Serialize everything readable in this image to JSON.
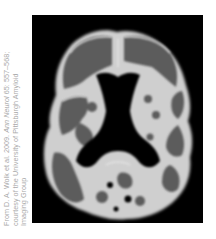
{
  "figure": {
    "image_description": "Axial PET amyloid brain scan (grayscale)",
    "colors": {
      "background": "#000000",
      "tissue_dark": "#5a5a5a",
      "tissue_bright": "#d8d8d8",
      "caption_text": "#a9a9a9"
    },
    "caption": {
      "line1_prefix": "From D. A. Wolk et al. 2009. ",
      "line1_journal": "Ann Neurol",
      "line1_suffix": " 65: 557–568;",
      "line2": "courtesy of the University of Pittsburgh Amyloid",
      "line3": "Imaging Group"
    }
  }
}
